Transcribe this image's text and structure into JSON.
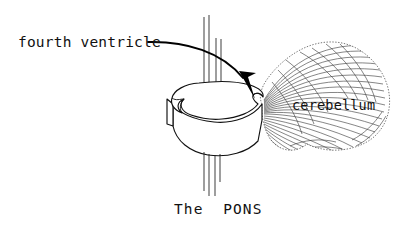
{
  "figure": {
    "title_caption": "The  PONS",
    "background_color": "#ffffff",
    "ink_color": "#111111",
    "labels": {
      "fourth_ventricle": "fourth ventricle",
      "cerebellum": "cerebellum",
      "caption": "The  PONS"
    },
    "annotations": [
      {
        "name": "fourth-ventricle-callout",
        "text": "fourth ventricle",
        "pointer": "curved-arrow",
        "points_to": "notch on posterior-right edge of pons"
      },
      {
        "name": "cerebellum-label",
        "text": "cerebellum",
        "pointer": "none",
        "points_to": "hatched fan-shaped mass at right"
      }
    ],
    "structures": [
      {
        "name": "pons",
        "description": "three-dimensional slab with notched left margin",
        "fill_color": "#ffffff",
        "stroke_color": "#111111"
      },
      {
        "name": "cerebellum",
        "description": "fan-shaped stippled mass with radiating arbor vitae striations",
        "fill_color": "#ffffff",
        "stroke_color": "#555555"
      },
      {
        "name": "fiber-tracts",
        "description": "four thin vertical lines passing through the pons above and below",
        "count": 4,
        "stroke_color": "#1a1a1a"
      }
    ]
  }
}
